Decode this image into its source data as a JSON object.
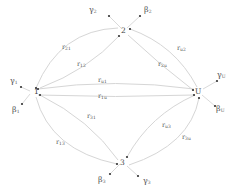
{
  "diagram": {
    "type": "state-transition-graph",
    "nodes": [
      {
        "id": "1",
        "label": "1",
        "x": 32,
        "y": 92
      },
      {
        "id": "2",
        "label": "2",
        "x": 124,
        "y": 31
      },
      {
        "id": "3",
        "label": "3",
        "x": 123,
        "y": 162
      },
      {
        "id": "U",
        "label": "U",
        "x": 199,
        "y": 92
      }
    ],
    "edges": [
      {
        "from": "2",
        "to": "1",
        "label_main": "r",
        "label_sub": "21"
      },
      {
        "from": "1",
        "to": "2",
        "label_main": "r",
        "label_sub": "12"
      },
      {
        "from": "U",
        "to": "1",
        "label_main": "r",
        "label_sub": "u1"
      },
      {
        "from": "1",
        "to": "U",
        "label_main": "r",
        "label_sub": "1u"
      },
      {
        "from": "U",
        "to": "2",
        "label_main": "r",
        "label_sub": "u2"
      },
      {
        "from": "2",
        "to": "U",
        "label_main": "r",
        "label_sub": "2u"
      },
      {
        "from": "3",
        "to": "1",
        "label_main": "r",
        "label_sub": "31"
      },
      {
        "from": "1",
        "to": "3",
        "label_main": "r",
        "label_sub": "13"
      },
      {
        "from": "U",
        "to": "3",
        "label_main": "r",
        "label_sub": "u3"
      },
      {
        "from": "3",
        "to": "U",
        "label_main": "r",
        "label_sub": "3u"
      }
    ],
    "external": [
      {
        "node": "1",
        "symbol": "γ",
        "sub": "1"
      },
      {
        "node": "1",
        "symbol": "β",
        "sub": "1"
      },
      {
        "node": "2",
        "symbol": "γ",
        "sub": "2"
      },
      {
        "node": "2",
        "symbol": "β",
        "sub": "2"
      },
      {
        "node": "3",
        "symbol": "β",
        "sub": "3"
      },
      {
        "node": "3",
        "symbol": "γ",
        "sub": "3"
      },
      {
        "node": "U",
        "symbol": "γ",
        "sub": "U"
      },
      {
        "node": "U",
        "symbol": "β",
        "sub": "U"
      }
    ],
    "colors": {
      "edge": "#d6d6d6",
      "arrow": "#333333",
      "text": "#555555"
    }
  }
}
